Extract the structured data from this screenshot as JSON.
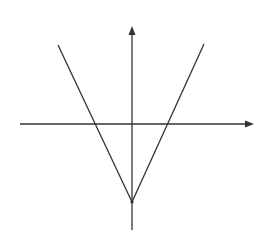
{
  "diagram": {
    "colors": {
      "background": "#ffffff",
      "stroke": "#333333"
    },
    "axes": {
      "x_axis": {
        "x1": 20,
        "y": 124,
        "x2": 254,
        "arrow": "right"
      },
      "y_axis": {
        "x": 132,
        "y1": 230,
        "y2": 26,
        "arrow": "up"
      }
    },
    "vertex": {
      "x": 132,
      "y": 202
    },
    "left_branch": {
      "from": [
        58,
        45
      ],
      "to": [
        132,
        202
      ],
      "x_intercept": [
        94,
        124
      ]
    },
    "right_branch": {
      "from": [
        204,
        44
      ],
      "to": [
        132,
        202
      ],
      "x_intercept": [
        168,
        124
      ]
    }
  }
}
